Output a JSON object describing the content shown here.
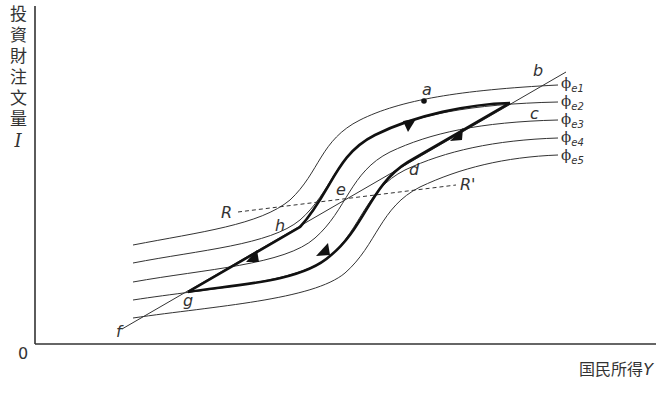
{
  "axes": {
    "y_label_chars": [
      "投",
      "資",
      "財",
      "注",
      "文",
      "量"
    ],
    "y_symbol": "I",
    "x_label": "国民所得",
    "x_symbol": "Y",
    "origin": "0"
  },
  "curves": [
    {
      "id": "phi_e1",
      "symbol": "ϕ",
      "subscript": "e1"
    },
    {
      "id": "phi_e2",
      "symbol": "ϕ",
      "subscript": "e2"
    },
    {
      "id": "phi_e3",
      "symbol": "ϕ",
      "subscript": "e3"
    },
    {
      "id": "phi_e4",
      "symbol": "ϕ",
      "subscript": "e4"
    },
    {
      "id": "phi_e5",
      "symbol": "ϕ",
      "subscript": "e5"
    }
  ],
  "points": {
    "a": "a",
    "b": "b",
    "c": "c",
    "d": "d",
    "e": "e",
    "f": "f",
    "g": "g",
    "h": "h"
  },
  "dashed_line": {
    "left": "R",
    "right": "R'"
  },
  "colors": {
    "line": "#222222",
    "thin": "#333333",
    "background": "#ffffff"
  }
}
